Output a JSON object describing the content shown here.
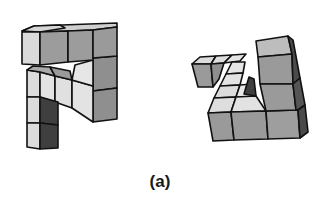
{
  "figure": {
    "caption": "(a)",
    "shapes": [
      {
        "id": "left",
        "name": "hook-shaped polycube"
      },
      {
        "id": "right",
        "name": "triangular-ring polycube"
      }
    ]
  },
  "colors": {
    "background": "#ffffff",
    "outline": "#111111",
    "light": "#d9d9d9",
    "lighter": "#e6e6e6",
    "medium": "#9a9a9a",
    "mid_dark": "#7d7d7d",
    "dark": "#4a4a4a"
  }
}
